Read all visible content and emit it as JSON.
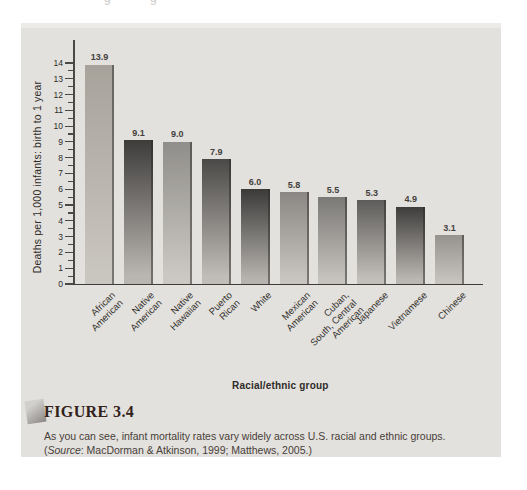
{
  "page": {
    "top_fragment_char": "g"
  },
  "figure": {
    "label": "FIGURE 3.4",
    "caption": "As you can see, infant mortality rates vary widely across U.S. racial and ethnic groups.",
    "source_open": "(",
    "source_word": "Source",
    "source_rest": ": MacDorman & Atkinson, 1999; Matthews, 2005.)"
  },
  "chart_data": {
    "type": "bar",
    "title": "",
    "xlabel": "Racial/ethnic group",
    "ylabel": "Deaths per 1,000 infants: birth to 1 year",
    "ylim": [
      0,
      14
    ],
    "ytick_step": 1,
    "minor_tick_step": 0.5,
    "grid": false,
    "legend": "none",
    "categories": [
      [
        "African",
        "American"
      ],
      [
        "Native",
        "American"
      ],
      [
        "Native",
        "Hawaiian"
      ],
      [
        "Puerto",
        "Rican"
      ],
      [
        "White"
      ],
      [
        "Mexican",
        "American"
      ],
      [
        "Cuban,",
        "South, Central",
        "American"
      ],
      [
        "Japanese"
      ],
      [
        "Vietnamese"
      ],
      [
        "Chinese"
      ]
    ],
    "values": [
      13.9,
      9.1,
      9.0,
      7.9,
      6.0,
      5.8,
      5.5,
      5.3,
      4.9,
      3.1
    ],
    "value_labels": [
      "13.9",
      "9.1",
      "9.0",
      "7.9",
      "6.0",
      "5.8",
      "5.5",
      "5.3",
      "4.9",
      "3.1"
    ],
    "bar_colors": [
      {
        "top": "#a7a29a",
        "bottom": "#c9c5bf"
      },
      {
        "top": "#3e3c3b",
        "bottom": "#b9b6b1"
      },
      {
        "top": "#908e8a",
        "bottom": "#cbc8c3"
      },
      {
        "top": "#4b4947",
        "bottom": "#c0bdb8"
      },
      {
        "top": "#3b3a39",
        "bottom": "#b6b3ae"
      },
      {
        "top": "#8a8784",
        "bottom": "#c8c5c0"
      },
      {
        "top": "#7b7976",
        "bottom": "#c6c3be"
      },
      {
        "top": "#5e5c5a",
        "bottom": "#c2bfba"
      },
      {
        "top": "#3f3d3c",
        "bottom": "#bab7b2"
      },
      {
        "top": "#96938f",
        "bottom": "#c6c3be"
      }
    ],
    "panel_background": "#e3e1dd",
    "axis_color": "#4b4947"
  }
}
